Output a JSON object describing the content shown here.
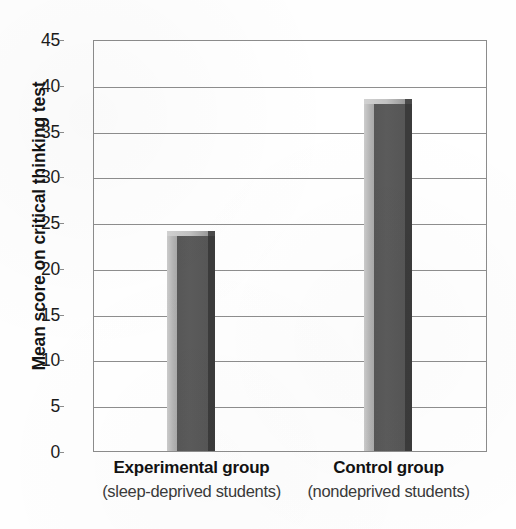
{
  "chart_data": {
    "type": "bar",
    "title": "",
    "xlabel": "",
    "ylabel": "Mean score on critical thinking test",
    "categories": [
      "Experimental group",
      "Control group"
    ],
    "category_sublabels": [
      "(sleep-deprived students)",
      "(nondeprived students)"
    ],
    "values": [
      24,
      38.5
    ],
    "ylim": [
      0,
      45
    ],
    "yticks": [
      0,
      5,
      10,
      15,
      20,
      25,
      30,
      35,
      40,
      45
    ],
    "ytick_labels": [
      "0",
      "5",
      "10",
      "15",
      "20",
      "25",
      "30",
      "35",
      "40",
      "45"
    ],
    "grid": true,
    "legend": "none",
    "series": [
      {
        "name": "Mean score",
        "values": [
          24,
          38.5
        ]
      }
    ],
    "bar_style": "3d-shaded"
  },
  "colors": {
    "bar_front": "#575757",
    "bar_left_face": "#b4b4b4",
    "bar_right_edge": "#3b3b3b",
    "bar_top_face": "#c6c6c6",
    "gridline": "#8e8e8e",
    "axis": "#8c8c8c",
    "text": "#141414",
    "background": "#ffffff"
  }
}
